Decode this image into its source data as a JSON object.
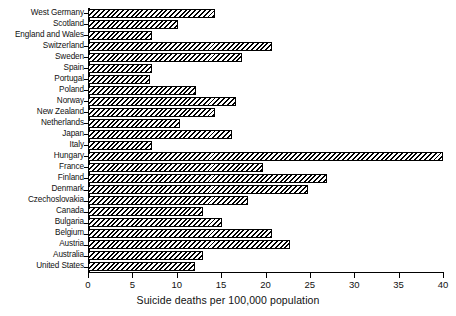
{
  "chart_data": {
    "type": "bar",
    "orientation": "horizontal",
    "title": "",
    "xlabel": "Suicide deaths per 100,000 population",
    "ylabel": "",
    "xlim": [
      0,
      40
    ],
    "xticks": [
      0,
      5,
      10,
      15,
      20,
      25,
      30,
      35,
      40
    ],
    "xtick_labels": [
      "0",
      "5",
      "10",
      "15",
      "20",
      "25",
      "30",
      "35",
      "40"
    ],
    "grid": false,
    "legend": null,
    "bar_style": {
      "fill": "diagonal-hatch",
      "edge_color": "#000000",
      "face_color": "#ffffff"
    },
    "categories": [
      "West Germany",
      "Scotland",
      "England and Wales",
      "Switzerland",
      "Sweden",
      "Spain",
      "Portugal",
      "Poland",
      "Norway",
      "New Zealand",
      "Netherlands",
      "Japan",
      "Italy",
      "Hungary",
      "France",
      "Finland",
      "Denmark",
      "Czechoslovakia",
      "Canada",
      "Bulgaria",
      "Belgium",
      "Austria",
      "Australia",
      "United States"
    ],
    "values": [
      14.3,
      10.1,
      7.2,
      20.7,
      17.4,
      7.2,
      7.0,
      12.2,
      16.7,
      14.3,
      10.4,
      16.2,
      7.2,
      40.0,
      19.7,
      26.9,
      24.8,
      18.0,
      13.0,
      15.1,
      20.7,
      22.8,
      13.0,
      12.1
    ]
  }
}
